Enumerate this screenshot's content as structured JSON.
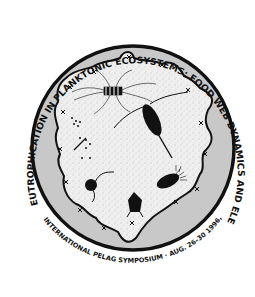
{
  "logo": {
    "top_arc_text": "EUTROPHICATION IN PLANKTONIC ECOSYSTEMS:   FOOD WEB DYNAMICS AND ELEMENTAL CYCLING",
    "bottom_arc_text": "INTERNATIONAL PELAG SYMPOSIUM · AUG. 26–30 1996, HELSINKI FINLAND",
    "colors": {
      "background": "#ffffff",
      "outline": "#111111",
      "ring": "#c8c8c8",
      "interior": "#eeeeee",
      "organism": "#111111"
    },
    "organisms": [
      {
        "name": "diatom-chain",
        "label": "diatom"
      },
      {
        "name": "copepod",
        "label": "copepod"
      },
      {
        "name": "ciliate",
        "label": "ciliate"
      },
      {
        "name": "flagellate",
        "label": "flagellate"
      },
      {
        "name": "rotifer",
        "label": "rotifer"
      },
      {
        "name": "bacteria-cluster",
        "label": "bacteria"
      }
    ]
  }
}
